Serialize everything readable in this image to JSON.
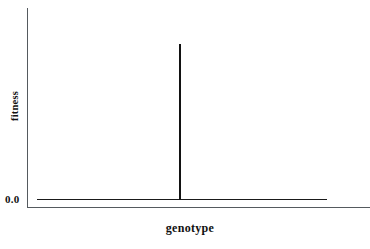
{
  "chart_data": {
    "type": "line",
    "title": "",
    "subtitle": "",
    "xlabel": "genotype",
    "ylabel": "fitness",
    "x_tick_labels": [],
    "y_tick_labels": [
      "0.0"
    ],
    "grid": false,
    "legend": null,
    "legend_position": "none",
    "xlim": [
      0,
      1
    ],
    "ylim": [
      0,
      1
    ],
    "annotations": [],
    "series": [
      {
        "name": "fitness landscape",
        "color": "#121212",
        "x": [
          0.033,
          0.489,
          0.493,
          0.497,
          1.0
        ],
        "values": [
          0.0,
          0.0,
          1.0,
          0.0,
          0.0
        ]
      }
    ],
    "description_points": {
      "baseline_value": 0.0,
      "peak_value": 1.0,
      "peak_x_fraction": 0.49
    }
  },
  "axes": {
    "y_tick_0": "0.0",
    "y_title": "fitness",
    "x_title": "genotype"
  },
  "colors": {
    "axis": "#555a5e",
    "data": "#121212",
    "text": "#111111",
    "background": "#ffffff"
  }
}
